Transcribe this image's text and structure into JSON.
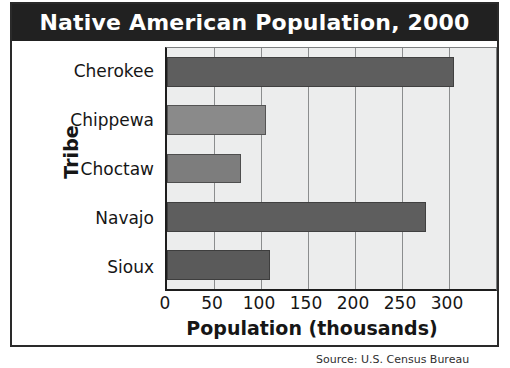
{
  "figure": {
    "title": "Native American Population, 2000",
    "source_note": "Source: U.S. Census Bureau"
  },
  "colors": {
    "title_bar": "#212121",
    "title_text": "#ffffff",
    "plot_background": "#eceded",
    "gridline": "#8b8d8e",
    "axis": "#1d1d1d",
    "bar_dark": "#5e5e5e",
    "bar_medium": "#878787"
  },
  "chart_data": {
    "type": "bar",
    "orientation": "horizontal",
    "title": "Native American Population, 2000",
    "xlabel": "Population (thousands)",
    "ylabel": "Tribe",
    "categories": [
      "Cherokee",
      "Chippewa",
      "Choctaw",
      "Navajo",
      "Sioux"
    ],
    "values": [
      305,
      105,
      79,
      276,
      110
    ],
    "xlim": [
      0,
      350
    ],
    "xticks": [
      0,
      50,
      100,
      150,
      200,
      250,
      300
    ],
    "xtick_labels": [
      "0",
      "50",
      "100",
      "150",
      "200",
      "250",
      "300"
    ],
    "grid": true,
    "grid_axis": "x",
    "legend": false,
    "bar_colors": [
      "#5e5e5e",
      "#8a8a8a",
      "#7d7d7d",
      "#5e5e5e",
      "#5a5a5a"
    ]
  }
}
